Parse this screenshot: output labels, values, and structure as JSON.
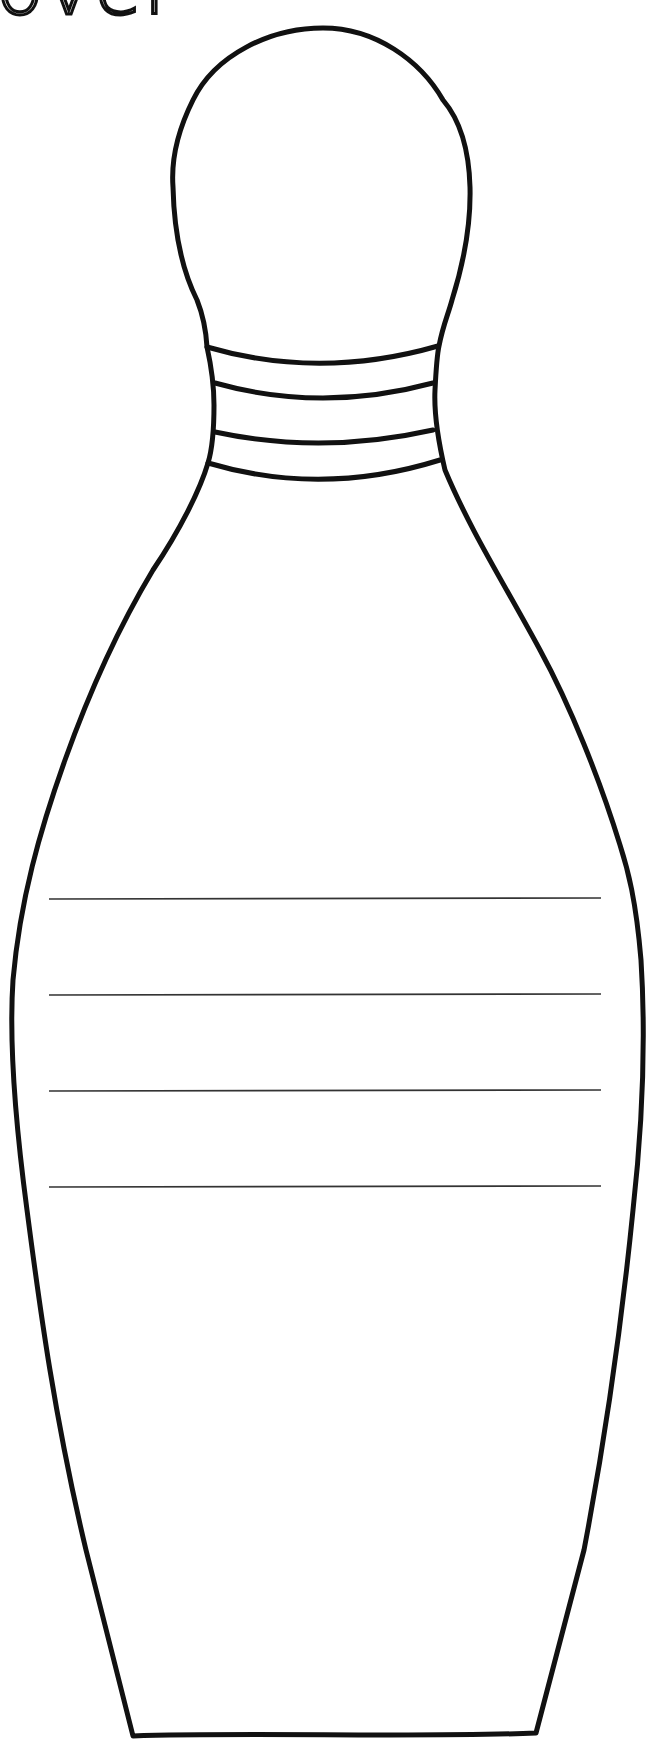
{
  "worksheet": {
    "title_fragment": "ovel",
    "subject": "bowling pin outline",
    "outline_color": "#111111",
    "background_color": "#ffffff",
    "neck_stripe_count": 4,
    "writing_line_count": 4,
    "writing_lines": [
      {
        "id": 1,
        "y": 899
      },
      {
        "id": 2,
        "y": 995
      },
      {
        "id": 3,
        "y": 1091
      },
      {
        "id": 4,
        "y": 1187
      }
    ]
  }
}
